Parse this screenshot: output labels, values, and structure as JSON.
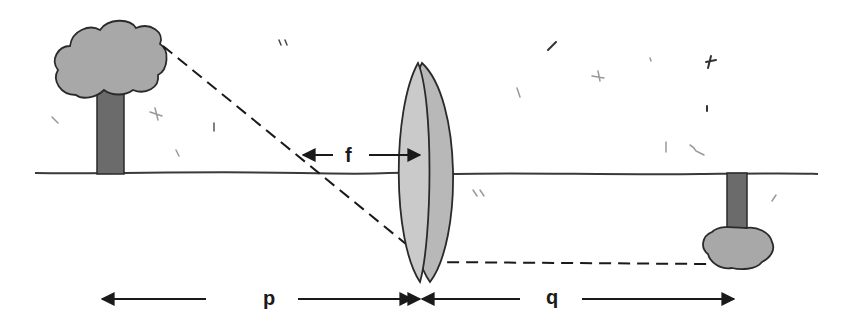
{
  "diagram": {
    "type": "thin-lens-image-formation",
    "labels": {
      "focal_length": "f",
      "object_distance": "p",
      "image_distance": "q"
    },
    "elements": [
      {
        "name": "object-tree",
        "description": "upright tree (object)"
      },
      {
        "name": "converging-lens",
        "description": "biconvex lens"
      },
      {
        "name": "image-tree",
        "description": "inverted tree (real image)"
      },
      {
        "name": "optical-axis",
        "description": "ground / principal axis line"
      },
      {
        "name": "ray",
        "description": "dashed ray from tree top through lens to image"
      }
    ],
    "colors": {
      "ink": "#2a2a2a",
      "canopy": "#a8a8a8",
      "trunk": "#6b6b6b",
      "lens": "#c2c2c2"
    }
  }
}
